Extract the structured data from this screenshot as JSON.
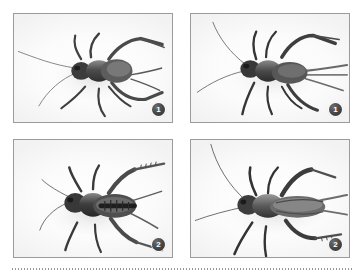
{
  "figure": {
    "panels": [
      {
        "id": "panel-top-left",
        "badge_label": "1",
        "subject": "cricket-nymph-dorsal-view",
        "position": "top-left"
      },
      {
        "id": "panel-top-right",
        "badge_label": "1",
        "subject": "cricket-nymph-dorsolateral-view",
        "position": "top-right"
      },
      {
        "id": "panel-bottom-left",
        "badge_label": "2",
        "subject": "cricket-nymph-dorsal-view",
        "position": "bottom-left"
      },
      {
        "id": "panel-bottom-right",
        "badge_label": "2",
        "subject": "cricket-adult-lateral-view",
        "position": "bottom-right"
      }
    ],
    "colors": {
      "page_background": "#ffffff",
      "panel_border": "#9b9b9b",
      "badge_fill": "#2e2e2e",
      "badge_text": "#ffffff",
      "rule": "#9a9a9a",
      "specimen_dark": "#3a3a3a",
      "specimen_mid": "#6f6f6f",
      "specimen_light": "#b4b4b4"
    }
  }
}
